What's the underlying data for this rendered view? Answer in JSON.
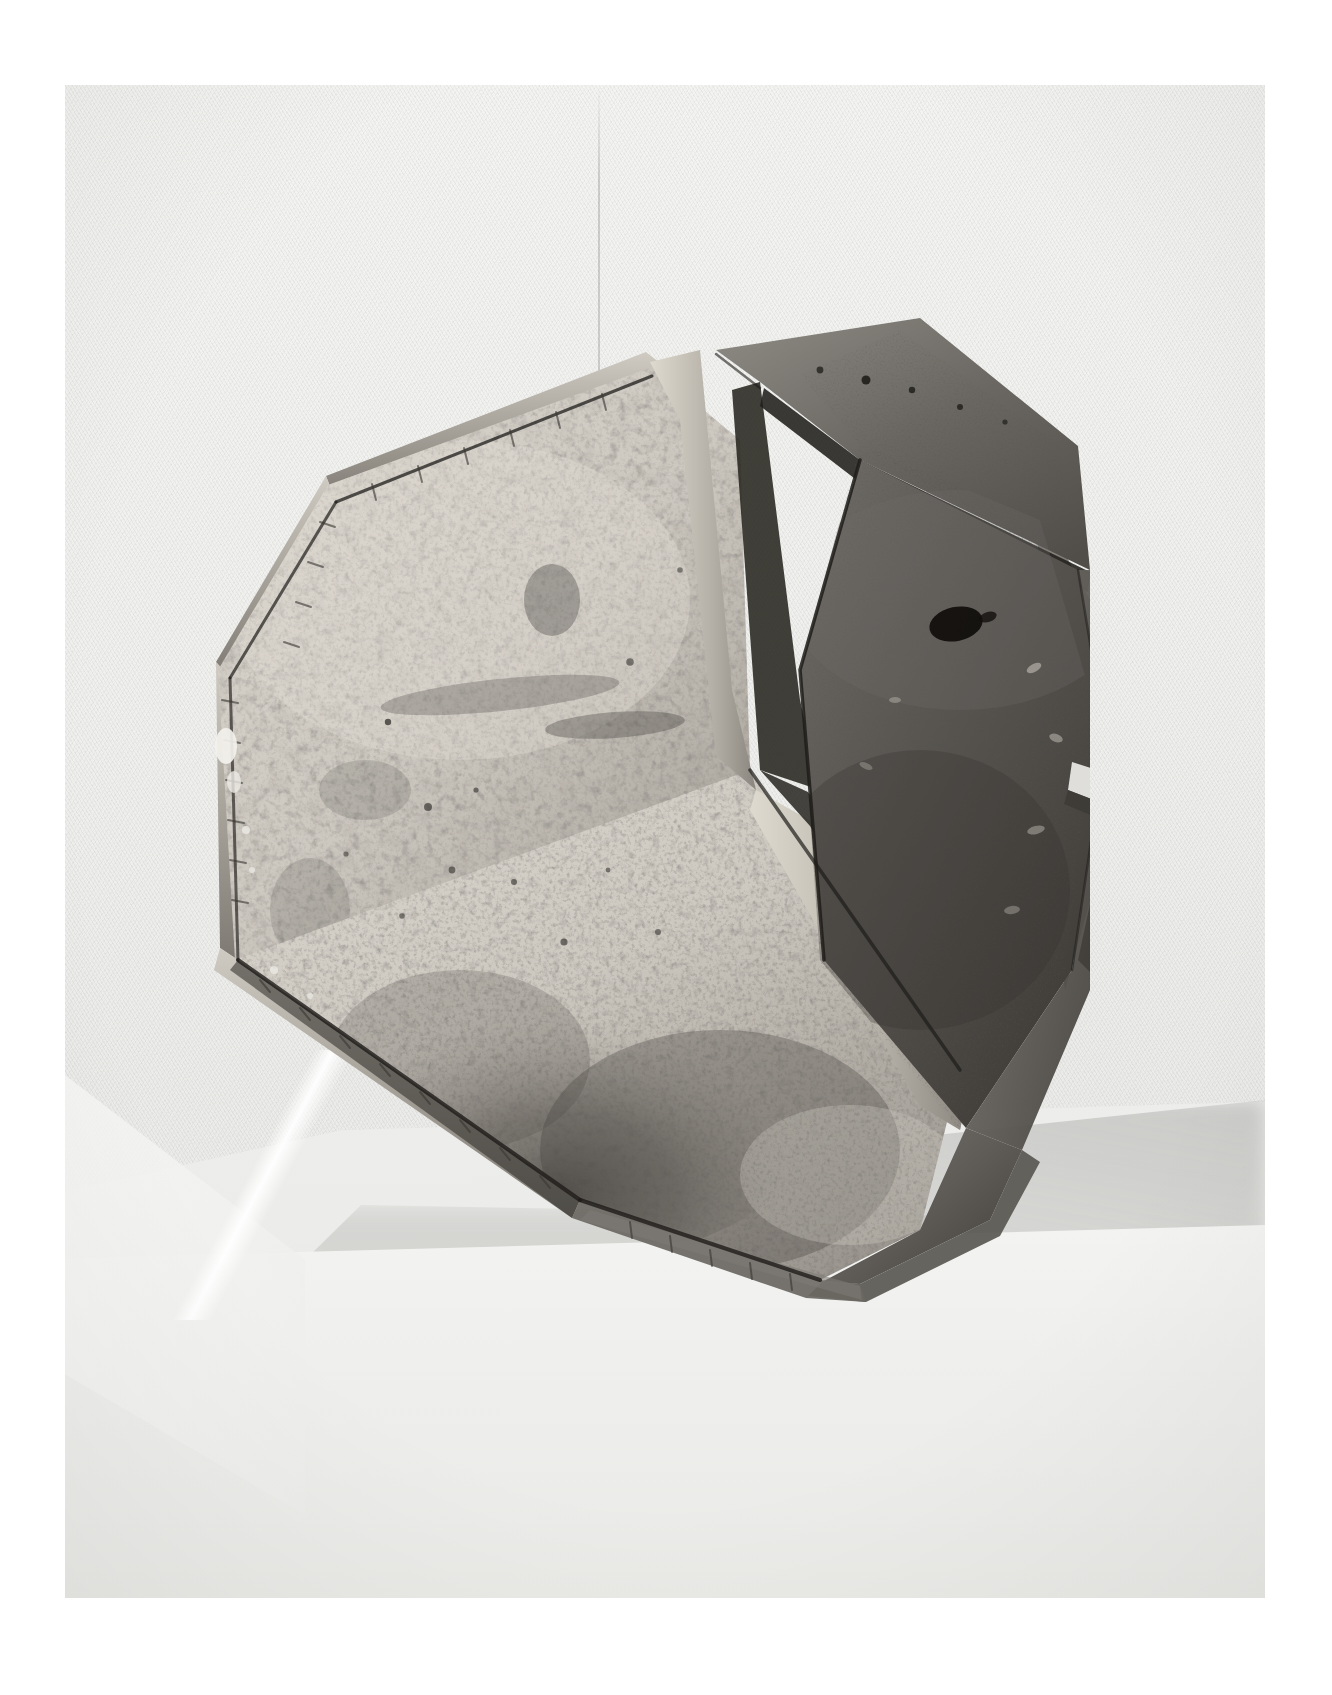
{
  "page": {
    "background_color": "#ffffff",
    "print_bounds": {
      "left": 65,
      "top": 85,
      "width": 1200,
      "height": 1513
    }
  },
  "photograph": {
    "medium": "black-and-white photographic print",
    "orientation": "portrait",
    "subject": "faceted polyhedral ceramic vessel",
    "backdrop_color": "#f1f1ef",
    "backdrop_texture": "woven cloth",
    "seam_note": "faint vertical crease in backdrop cloth",
    "lighting": "soft diffuse from upper left"
  },
  "subject": {
    "name": "faceted ceramic polyhedron",
    "form": "truncated polyhedron / dodecahedral vessel",
    "surface": "raku-fired crackle glaze",
    "facet_count_visible": 9,
    "tone_light": "#c9c5bd",
    "tone_mid": "#8b8781",
    "tone_dark": "#4a4744",
    "tone_deepest": "#1d1b1a",
    "features": [
      "crazed / craquelure glaze network on light facets",
      "smoked carbon mottling across lower left facet",
      "raised ridge seams between facets",
      "dark matte glaze on right-hand facets",
      "dark burn mark near centre of large right facet",
      "chipped edge at right shoulder"
    ]
  },
  "plinth": {
    "name": "cloth-covered display plinth",
    "top_color": "#ececea",
    "front_color": "#eeeeec",
    "shadow_color": "#8c8c89",
    "shadow_note": "soft cast shadow falling to the right of the vessel"
  }
}
